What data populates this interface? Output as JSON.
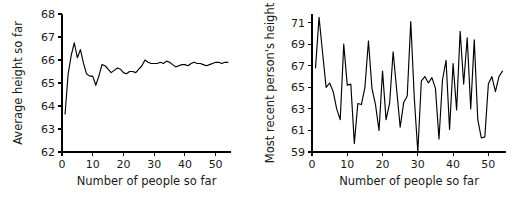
{
  "figure": {
    "background": "#ffffff",
    "ink": "#000000",
    "panel_count": 2
  },
  "chart_data": [
    {
      "id": "average-height-so-far",
      "type": "line",
      "title": "",
      "xlabel": "Number of people so far",
      "ylabel": "Average height so far",
      "xlim": [
        0,
        55
      ],
      "ylim": [
        62,
        68
      ],
      "xticks": [
        0,
        10,
        20,
        30,
        40,
        50
      ],
      "yticks": [
        62,
        63,
        64,
        65,
        66,
        67,
        68
      ],
      "grid": false,
      "legend": null,
      "series_color": "#000000",
      "x": [
        1,
        2,
        3,
        4,
        5,
        6,
        7,
        8,
        9,
        10,
        11,
        12,
        13,
        14,
        15,
        16,
        17,
        18,
        19,
        20,
        21,
        22,
        23,
        24,
        25,
        26,
        27,
        28,
        29,
        30,
        31,
        32,
        33,
        34,
        35,
        36,
        37,
        38,
        39,
        40,
        41,
        42,
        43,
        44,
        45,
        46,
        47,
        48,
        49,
        50,
        51,
        52,
        53,
        54
      ],
      "values": [
        63.65,
        65.4,
        66.2,
        66.75,
        66.1,
        66.45,
        65.85,
        65.4,
        65.3,
        65.3,
        64.9,
        65.3,
        65.8,
        65.75,
        65.6,
        65.45,
        65.55,
        65.65,
        65.6,
        65.45,
        65.4,
        65.5,
        65.5,
        65.45,
        65.6,
        65.75,
        66.0,
        65.9,
        65.85,
        65.85,
        65.85,
        65.9,
        65.85,
        65.95,
        65.9,
        65.8,
        65.7,
        65.75,
        65.8,
        65.8,
        65.75,
        65.85,
        65.9,
        65.85,
        65.85,
        65.8,
        65.75,
        65.8,
        65.85,
        65.9,
        65.9,
        65.85,
        65.9,
        65.9
      ]
    },
    {
      "id": "most-recent-persons-height",
      "type": "line",
      "title": "",
      "xlabel": "Number of people so far",
      "ylabel": "Most recent person's height",
      "xlim": [
        0,
        55
      ],
      "ylim": [
        59,
        71.8
      ],
      "xticks": [
        0,
        10,
        20,
        30,
        40,
        50
      ],
      "yticks": [
        59,
        61,
        63,
        65,
        67,
        69,
        71
      ],
      "grid": false,
      "legend": null,
      "series_color": "#000000",
      "x": [
        1,
        2,
        3,
        4,
        5,
        6,
        7,
        8,
        9,
        10,
        11,
        12,
        13,
        14,
        15,
        16,
        17,
        18,
        19,
        20,
        21,
        22,
        23,
        24,
        25,
        26,
        27,
        28,
        29,
        30,
        31,
        32,
        33,
        34,
        35,
        36,
        37,
        38,
        39,
        40,
        41,
        42,
        43,
        44,
        45,
        46,
        47,
        48,
        49,
        50,
        51,
        52,
        53,
        54
      ],
      "values": [
        66.8,
        71.5,
        68.2,
        65.0,
        65.4,
        64.6,
        63.0,
        62.0,
        69.0,
        65.2,
        65.3,
        59.8,
        63.5,
        63.4,
        65.0,
        69.3,
        64.9,
        63.4,
        61.0,
        66.5,
        62.0,
        63.5,
        68.3,
        64.8,
        61.3,
        63.6,
        64.2,
        71.1,
        64.0,
        59.0,
        65.6,
        66.0,
        65.4,
        65.9,
        64.9,
        60.2,
        65.7,
        67.5,
        61.1,
        67.2,
        62.9,
        70.2,
        65.3,
        69.6,
        63.0,
        69.4,
        62.0,
        60.3,
        60.4,
        65.3,
        66.0,
        64.6,
        66.0,
        66.5
      ]
    }
  ]
}
